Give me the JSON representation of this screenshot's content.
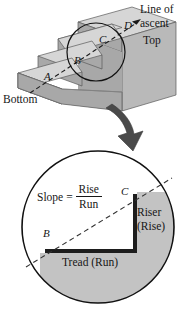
{
  "figure": {
    "colors": {
      "tread_top": "#d6d6d6",
      "riser_face": "#a8a8a8",
      "side_face": "#b9b9b9",
      "inset_fill": "#c3c3c3",
      "outline": "#161616",
      "white": "#ffffff",
      "arrow": "#3a3a3a"
    }
  },
  "staircase": {
    "line_of_ascent_label": "Line of\nascent",
    "top_label": "Top",
    "bottom_label": "Bottom",
    "points": [
      {
        "id": "A",
        "label": "A"
      },
      {
        "id": "B",
        "label": "B"
      },
      {
        "id": "C",
        "label": "C"
      },
      {
        "id": "D",
        "label": "D"
      }
    ],
    "step_count": 4
  },
  "inset": {
    "slope_word": "Slope",
    "equals": "=",
    "numerator": "Rise",
    "denominator": "Run",
    "riser_label": "Riser\n(Rise)",
    "riser_line1": "Riser",
    "riser_line2": "(Rise)",
    "tread_label": "Tread (Run)",
    "points": [
      {
        "id": "B",
        "label": "B"
      },
      {
        "id": "C",
        "label": "C"
      }
    ]
  },
  "chart_data": {
    "type": "diagram",
    "annotations": [
      "Line of ascent",
      "Top",
      "Bottom",
      "A",
      "B",
      "C",
      "D",
      "Slope = Rise / Run",
      "Riser (Rise)",
      "Tread (Run)"
    ],
    "relation": "Slope = Rise / Run"
  }
}
